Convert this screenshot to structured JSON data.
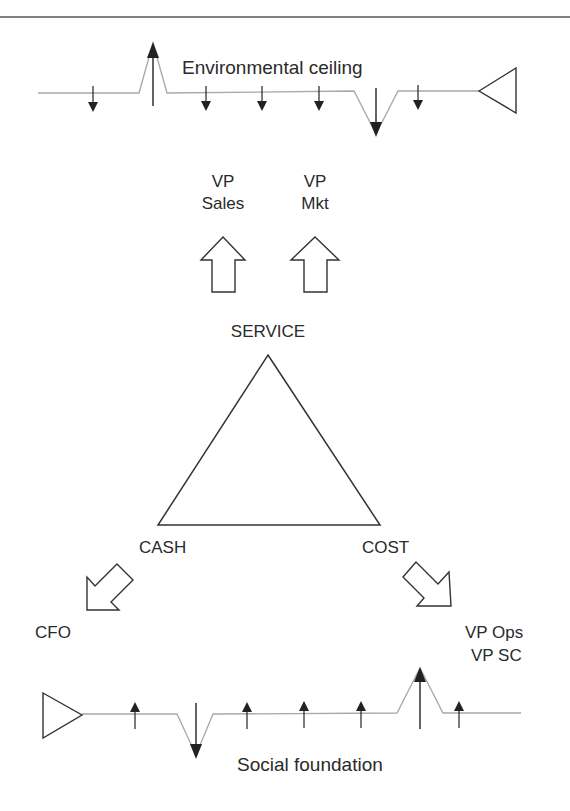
{
  "diagram": {
    "top_boundary": {
      "label": "Environmental ceiling"
    },
    "bottom_boundary": {
      "label": "Social foundation"
    },
    "triangle": {
      "top": "SERVICE",
      "left": "CASH",
      "right": "COST"
    },
    "roles": {
      "vp_sales": {
        "line1": "VP",
        "line2": "Sales"
      },
      "vp_mkt": {
        "line1": "VP",
        "line2": "Mkt"
      },
      "cfo": "CFO",
      "vp_ops": "VP Ops",
      "vp_sc": "VP SC"
    },
    "colors": {
      "stroke": "#333333",
      "boundary_line": "#a8a8a8",
      "text": "#2a2a2a"
    }
  }
}
